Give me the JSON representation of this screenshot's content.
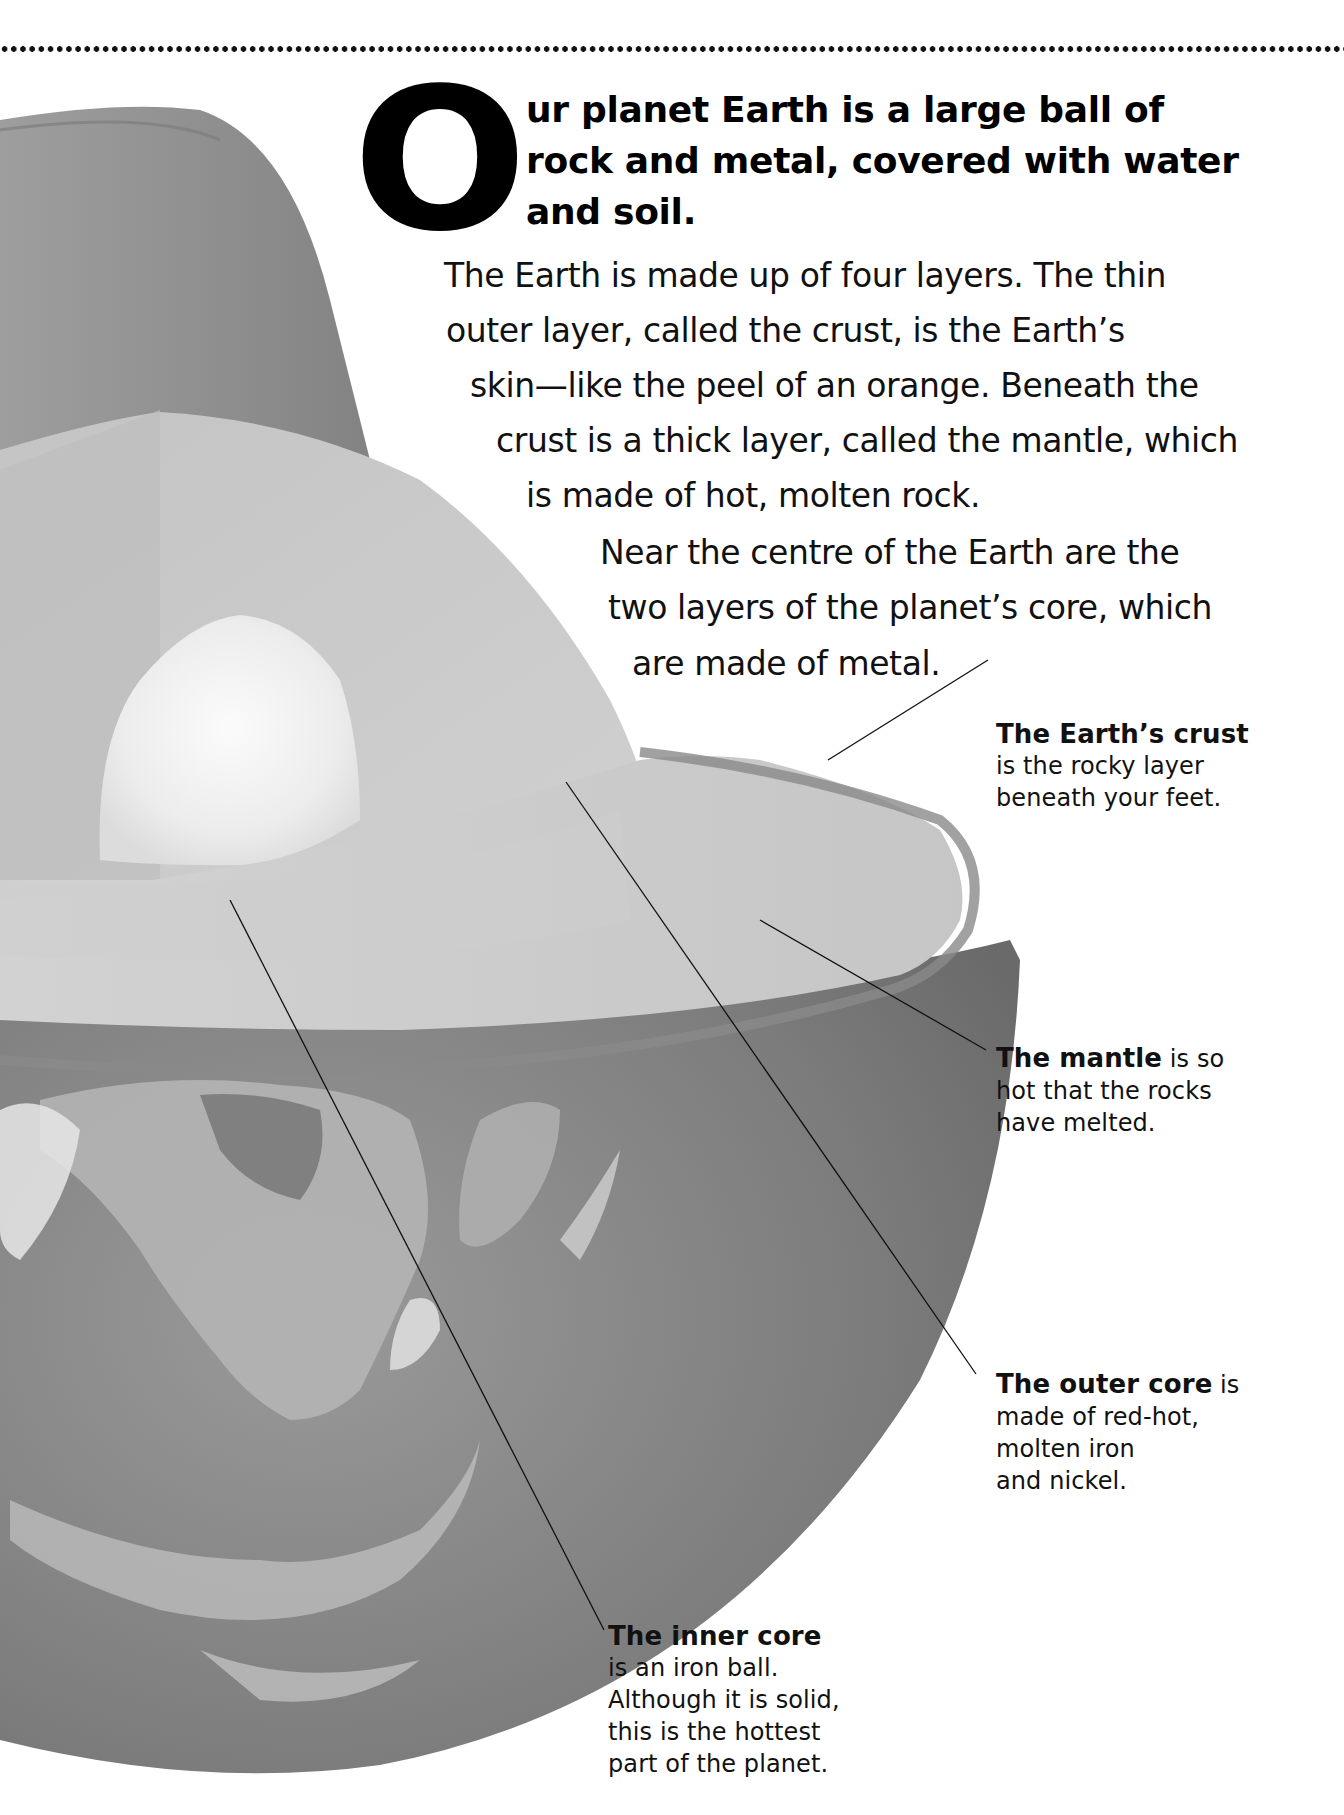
{
  "lede": {
    "drop_cap": "O",
    "lines": [
      "ur planet Earth is a large ball of",
      "rock and metal, covered with water",
      "and soil."
    ]
  },
  "body": {
    "paragraph_1": [
      "The Earth is made up of four layers. The thin",
      "outer layer, called the crust, is the Earth’s",
      "skin—like the peel of an orange. Beneath the",
      "crust is a thick layer, called the mantle, which",
      "is made of hot, molten rock."
    ],
    "paragraph_2": [
      "Near the centre of the Earth are the",
      "two layers of the planet’s core, which",
      "are made of metal."
    ]
  },
  "captions": {
    "crust": {
      "title": "The Earth’s crust",
      "lines": [
        "is the rocky layer",
        "beneath your feet."
      ]
    },
    "mantle": {
      "title": "The mantle",
      "title_suffix": " is so",
      "lines": [
        "hot that the rocks",
        "have melted."
      ]
    },
    "outer_core": {
      "title": "The outer core",
      "title_suffix": " is",
      "lines": [
        "made of red-hot,",
        "molten iron",
        "and nickel."
      ]
    },
    "inner_core": {
      "title": "The inner core",
      "lines": [
        "is an iron ball.",
        "Although it is solid,",
        "this is the hottest",
        "part of the planet."
      ]
    }
  },
  "illustration": {
    "subject": "cutaway-earth-layers",
    "colors": {
      "crust_surface": "#8c8c8c",
      "mantle_section": "#c9c9c9",
      "outer_core": "#d9d9d9",
      "inner_core": "#f2f2f2",
      "globe_ocean": "#7a7a7a",
      "land_cloud": "#bdbdbd"
    }
  }
}
